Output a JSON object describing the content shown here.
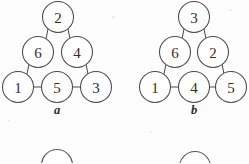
{
  "page": {
    "background_color": "#fdfdfd",
    "ink_color": "#4a4a4a",
    "width": 249,
    "height": 163
  },
  "figures": [
    {
      "id": "a",
      "label": "a",
      "label_x": 57,
      "label_y": 114,
      "description": "magic triangle puzzle with six numbered circles",
      "nodes": [
        {
          "value": "2",
          "cx": 58,
          "cy": 17,
          "r": 15.5,
          "position": "apex"
        },
        {
          "value": "6",
          "cx": 38,
          "cy": 52,
          "r": 15.5,
          "position": "left-middle"
        },
        {
          "value": "4",
          "cx": 77,
          "cy": 52,
          "r": 15.5,
          "position": "right-middle"
        },
        {
          "value": "1",
          "cx": 18,
          "cy": 87,
          "r": 15.5,
          "position": "bottom-left"
        },
        {
          "value": "5",
          "cx": 57,
          "cy": 87,
          "r": 15.5,
          "position": "bottom-middle"
        },
        {
          "value": "3",
          "cx": 96,
          "cy": 87,
          "r": 15.5,
          "position": "bottom-right"
        }
      ],
      "edges": [
        {
          "from": "2",
          "to": "6",
          "x1": 48,
          "y1": 29,
          "x2": 46,
          "y2": 39
        },
        {
          "from": "2",
          "to": "4",
          "x1": 68,
          "y1": 29,
          "x2": 70,
          "y2": 39
        },
        {
          "from": "6",
          "to": "1",
          "x1": 29,
          "y1": 64,
          "x2": 27,
          "y2": 74
        },
        {
          "from": "4",
          "to": "3",
          "x1": 86,
          "y1": 64,
          "x2": 88,
          "y2": 74
        },
        {
          "from": "1",
          "to": "5",
          "x1": 34,
          "y1": 87,
          "x2": 41,
          "y2": 87
        },
        {
          "from": "5",
          "to": "3",
          "x1": 73,
          "y1": 87,
          "x2": 80,
          "y2": 87
        }
      ]
    },
    {
      "id": "b",
      "label": "b",
      "label_x": 69,
      "label_y": 114,
      "description": "magic triangle puzzle with six numbered circles",
      "nodes": [
        {
          "value": "3",
          "cx": 69,
          "cy": 17,
          "r": 15.5,
          "position": "apex"
        },
        {
          "value": "6",
          "cx": 50,
          "cy": 52,
          "r": 15.5,
          "position": "left-middle"
        },
        {
          "value": "2",
          "cx": 88,
          "cy": 52,
          "r": 15.5,
          "position": "right-middle"
        },
        {
          "value": "1",
          "cx": 30,
          "cy": 87,
          "r": 15.5,
          "position": "bottom-left"
        },
        {
          "value": "4",
          "cx": 69,
          "cy": 87,
          "r": 15.5,
          "position": "bottom-middle"
        },
        {
          "value": "5",
          "cx": 106,
          "cy": 87,
          "r": 15.5,
          "position": "bottom-right"
        }
      ],
      "edges": [
        {
          "from": "3",
          "to": "6",
          "x1": 59,
          "y1": 29,
          "x2": 57,
          "y2": 39
        },
        {
          "from": "3",
          "to": "2",
          "x1": 79,
          "y1": 29,
          "x2": 81,
          "y2": 39
        },
        {
          "from": "6",
          "to": "1",
          "x1": 41,
          "y1": 64,
          "x2": 39,
          "y2": 74
        },
        {
          "from": "2",
          "to": "5",
          "x1": 97,
          "y1": 64,
          "x2": 99,
          "y2": 74
        },
        {
          "from": "1",
          "to": "4",
          "x1": 46,
          "y1": 87,
          "x2": 53,
          "y2": 87
        },
        {
          "from": "4",
          "to": "5",
          "x1": 85,
          "y1": 87,
          "x2": 91,
          "y2": 87
        }
      ]
    }
  ],
  "next_figure": {
    "description": "tops of two circles from the following figure, cropped by the bottom edge",
    "partial_nodes": [
      {
        "cx": 57,
        "cy": 40,
        "r": 15.5,
        "id": "next-left"
      },
      {
        "cx": 195,
        "cy": 42,
        "r": 15.5,
        "id": "next-right"
      }
    ]
  }
}
